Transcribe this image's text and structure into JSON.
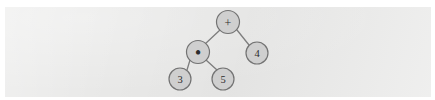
{
  "figure": {
    "expression": "3 * 5 + 4",
    "panel_color": "#e8e8e7",
    "node_fill": "#cfcfcf",
    "node_stroke": "#737373",
    "edge_color": "#7d7d7d",
    "label_color": "#2c2c2c"
  },
  "tree": {
    "nodes": [
      {
        "id": "root",
        "label": "+",
        "kind": "operator",
        "cx": 228,
        "cy": 22,
        "r": 11.5
      },
      {
        "id": "times",
        "label": "•",
        "kind": "operator",
        "cx": 198,
        "cy": 52,
        "r": 11.5
      },
      {
        "id": "four",
        "label": "4",
        "kind": "operand",
        "cx": 257,
        "cy": 53,
        "r": 11.0
      },
      {
        "id": "three",
        "label": "3",
        "kind": "operand",
        "cx": 180,
        "cy": 79,
        "r": 11.0
      },
      {
        "id": "five",
        "label": "5",
        "kind": "operand",
        "cx": 223,
        "cy": 79,
        "r": 11.0
      }
    ],
    "edges": [
      {
        "id": "root-times",
        "from": "root",
        "to": "times",
        "x1": 220,
        "y1": 30,
        "x2": 205,
        "y2": 44
      },
      {
        "id": "root-four",
        "from": "root",
        "to": "four",
        "x1": 237,
        "y1": 30,
        "x2": 249,
        "y2": 45
      },
      {
        "id": "times-three",
        "from": "times",
        "to": "three",
        "x1": 190,
        "y1": 60,
        "x2": 187,
        "y2": 70
      },
      {
        "id": "times-five",
        "from": "times",
        "to": "five",
        "x1": 206,
        "y1": 60,
        "x2": 217,
        "y2": 70
      }
    ]
  }
}
